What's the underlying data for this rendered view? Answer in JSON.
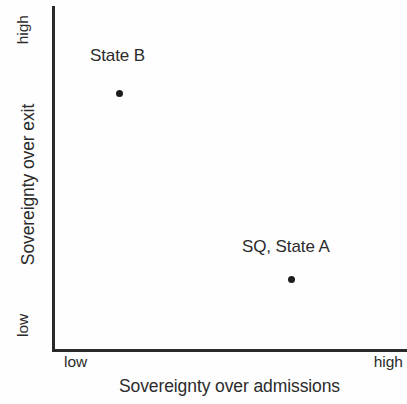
{
  "chart_data": {
    "type": "scatter",
    "title": "",
    "xlabel": "Sovereignty over admissions",
    "ylabel": "Sovereignty over exit",
    "xtick_labels": [
      "low",
      "high"
    ],
    "ytick_labels": [
      "low",
      "high"
    ],
    "xlim": [
      "low",
      "high"
    ],
    "ylim": [
      "low",
      "high"
    ],
    "grid": false,
    "legend": "none",
    "axis_style": "L-shaped spines, no ticks, no numeric scale",
    "points": [
      {
        "label": "State B",
        "x_qualitative": "low",
        "y_qualitative": "high",
        "x_frac": 0.19,
        "y_frac": 0.76,
        "marker": "filled-circle",
        "color": "#1c1c1c"
      },
      {
        "label": "SQ, State A",
        "x_qualitative": "high",
        "y_qualitative": "low",
        "x_frac": 0.68,
        "y_frac": 0.22,
        "marker": "filled-circle",
        "color": "#1c1c1c"
      }
    ]
  },
  "axes": {
    "y": {
      "title": "Sovereignty over exit",
      "tick_high": "high",
      "tick_low": "low"
    },
    "x": {
      "title": "Sovereignty over admissions",
      "tick_high": "high",
      "tick_low": "low"
    }
  },
  "labels": {
    "state_b": "State B",
    "state_a": "SQ, State A"
  },
  "colors": {
    "axis": "#2a2a2a",
    "text": "#2b2b2b",
    "marker": "#1c1c1c",
    "background": "#fefefe"
  }
}
